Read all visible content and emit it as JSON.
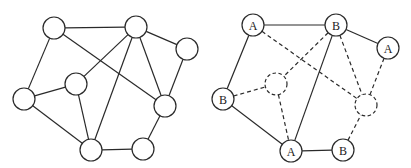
{
  "diagram": {
    "title": "",
    "node_radius": 11,
    "colors": {
      "stroke": "#2a2a2a",
      "fill": "#ffffff",
      "text": "#222222"
    },
    "graphs": [
      {
        "name": "unlabeled-graph",
        "nodes": [
          {
            "id": "n0",
            "x": 54,
            "y": 28,
            "label": "",
            "style": "solid"
          },
          {
            "id": "n1",
            "x": 136,
            "y": 27,
            "label": "",
            "style": "solid"
          },
          {
            "id": "n2",
            "x": 187,
            "y": 49,
            "label": "",
            "style": "solid"
          },
          {
            "id": "n3",
            "x": 24,
            "y": 99,
            "label": "",
            "style": "solid"
          },
          {
            "id": "n4",
            "x": 76,
            "y": 84,
            "label": "",
            "style": "solid"
          },
          {
            "id": "n5",
            "x": 165,
            "y": 106,
            "label": "",
            "style": "solid"
          },
          {
            "id": "n6",
            "x": 91,
            "y": 150,
            "label": "",
            "style": "solid"
          },
          {
            "id": "n7",
            "x": 143,
            "y": 149,
            "label": "",
            "style": "solid"
          }
        ],
        "edges": [
          {
            "from": "n0",
            "to": "n1",
            "style": "solid"
          },
          {
            "from": "n0",
            "to": "n3",
            "style": "solid"
          },
          {
            "from": "n0",
            "to": "n5",
            "style": "solid"
          },
          {
            "from": "n1",
            "to": "n2",
            "style": "solid"
          },
          {
            "from": "n1",
            "to": "n4",
            "style": "solid"
          },
          {
            "from": "n1",
            "to": "n6",
            "style": "solid"
          },
          {
            "from": "n1",
            "to": "n5",
            "style": "solid"
          },
          {
            "from": "n2",
            "to": "n5",
            "style": "solid"
          },
          {
            "from": "n3",
            "to": "n4",
            "style": "solid"
          },
          {
            "from": "n3",
            "to": "n6",
            "style": "solid"
          },
          {
            "from": "n4",
            "to": "n6",
            "style": "solid"
          },
          {
            "from": "n6",
            "to": "n7",
            "style": "solid"
          },
          {
            "from": "n7",
            "to": "n5",
            "style": "solid"
          }
        ]
      },
      {
        "name": "labeled-graph",
        "nodes": [
          {
            "id": "m0",
            "x": 253,
            "y": 25,
            "label": "A",
            "style": "solid"
          },
          {
            "id": "m1",
            "x": 336,
            "y": 25,
            "label": "B",
            "style": "solid"
          },
          {
            "id": "m2",
            "x": 388,
            "y": 48,
            "label": "A",
            "style": "solid"
          },
          {
            "id": "m3",
            "x": 223,
            "y": 99,
            "label": "B",
            "style": "solid"
          },
          {
            "id": "m4",
            "x": 276,
            "y": 84,
            "label": "",
            "style": "dashed"
          },
          {
            "id": "m5",
            "x": 366,
            "y": 105,
            "label": "",
            "style": "dashed"
          },
          {
            "id": "m6",
            "x": 291,
            "y": 151,
            "label": "A",
            "style": "solid"
          },
          {
            "id": "m7",
            "x": 343,
            "y": 150,
            "label": "B",
            "style": "solid"
          }
        ],
        "edges": [
          {
            "from": "m0",
            "to": "m1",
            "style": "solid"
          },
          {
            "from": "m0",
            "to": "m3",
            "style": "solid"
          },
          {
            "from": "m0",
            "to": "m5",
            "style": "dashed"
          },
          {
            "from": "m1",
            "to": "m2",
            "style": "solid"
          },
          {
            "from": "m1",
            "to": "m4",
            "style": "dashed"
          },
          {
            "from": "m1",
            "to": "m6",
            "style": "solid"
          },
          {
            "from": "m1",
            "to": "m5",
            "style": "dashed"
          },
          {
            "from": "m2",
            "to": "m5",
            "style": "dashed"
          },
          {
            "from": "m3",
            "to": "m4",
            "style": "dashed"
          },
          {
            "from": "m3",
            "to": "m6",
            "style": "solid"
          },
          {
            "from": "m4",
            "to": "m6",
            "style": "dashed"
          },
          {
            "from": "m6",
            "to": "m7",
            "style": "solid"
          },
          {
            "from": "m7",
            "to": "m5",
            "style": "dashed"
          }
        ]
      }
    ]
  }
}
